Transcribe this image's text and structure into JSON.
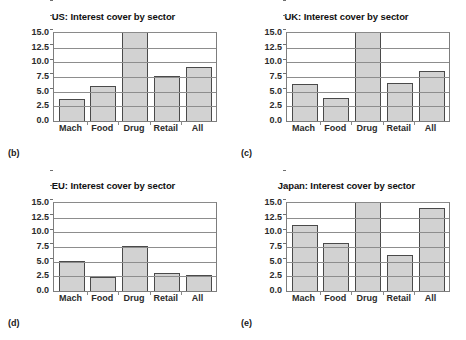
{
  "figure": {
    "background_color": "#ffffff",
    "bar_fill_color": "#d2d2d2",
    "bar_border_color": "#4a4a4a",
    "grid_color": "#8d8d8d",
    "axis_color": "#7d7d7d"
  },
  "panels": [
    {
      "caption": "(b)",
      "title": "US: Interest cover by sector",
      "chart_data": {
        "type": "bar",
        "title": "US: Interest cover by sector",
        "xlabel": "",
        "ylabel": "",
        "ylim": [
          0,
          15
        ],
        "yticks": [
          0.0,
          2.5,
          5.0,
          7.5,
          10.0,
          12.5,
          15.0
        ],
        "ytick_labels": [
          "0.0",
          "2.5",
          "5.0",
          "7.5",
          "10.0",
          "12.5",
          "15.0"
        ],
        "grid": true,
        "legend": "none",
        "categories": [
          "Mach",
          "Food",
          "Drug",
          "Retail",
          "All"
        ],
        "values": [
          3.7,
          6.0,
          15.4,
          7.7,
          9.2
        ],
        "clipped": [
          false,
          false,
          true,
          false,
          false
        ],
        "notes": "Drug bar exceeds the 15.0 axis maximum and is clipped at the top of the plot frame."
      }
    },
    {
      "caption": "(c)",
      "title": "UK: Interest cover by sector",
      "chart_data": {
        "type": "bar",
        "title": "UK: Interest cover by sector",
        "xlabel": "",
        "ylabel": "",
        "ylim": [
          0,
          15
        ],
        "yticks": [
          0.0,
          2.5,
          5.0,
          7.5,
          10.0,
          12.5,
          15.0
        ],
        "ytick_labels": [
          "0.0",
          "2.5",
          "5.0",
          "7.5",
          "10.0",
          "12.5",
          "15.0"
        ],
        "grid": true,
        "legend": "none",
        "categories": [
          "Mach",
          "Food",
          "Drug",
          "Retail",
          "All"
        ],
        "values": [
          6.3,
          4.0,
          15.4,
          6.4,
          8.6
        ],
        "clipped": [
          false,
          false,
          true,
          false,
          false
        ],
        "notes": "Drug bar exceeds the 15.0 axis maximum and is clipped at the top of the plot frame."
      }
    },
    {
      "caption": "(d)",
      "title": "EU: Interest cover by sector",
      "chart_data": {
        "type": "bar",
        "title": "EU: Interest cover by sector",
        "xlabel": "",
        "ylabel": "",
        "ylim": [
          0,
          15
        ],
        "yticks": [
          0.0,
          2.5,
          5.0,
          7.5,
          10.0,
          12.5,
          15.0
        ],
        "ytick_labels": [
          "0.0",
          "2.5",
          "5.0",
          "7.5",
          "10.0",
          "12.5",
          "15.0"
        ],
        "grid": true,
        "legend": "none",
        "categories": [
          "Mach",
          "Food",
          "Drug",
          "Retail",
          "All"
        ],
        "values": [
          5.1,
          2.4,
          7.7,
          3.0,
          2.8
        ],
        "clipped": [
          false,
          false,
          false,
          false,
          false
        ],
        "notes": ""
      }
    },
    {
      "caption": "(e)",
      "title": "Japan: Interest cover by sector",
      "chart_data": {
        "type": "bar",
        "title": "Japan: Interest cover by sector",
        "xlabel": "",
        "ylabel": "",
        "ylim": [
          0,
          15
        ],
        "yticks": [
          0.0,
          2.5,
          5.0,
          7.5,
          10.0,
          12.5,
          15.0
        ],
        "ytick_labels": [
          "0.0",
          "2.5",
          "5.0",
          "7.5",
          "10.0",
          "12.5",
          "15.0"
        ],
        "grid": true,
        "legend": "none",
        "categories": [
          "Mach",
          "Food",
          "Drug",
          "Retail",
          "All"
        ],
        "values": [
          11.2,
          8.1,
          15.4,
          6.2,
          14.2
        ],
        "clipped": [
          false,
          false,
          true,
          false,
          false
        ],
        "notes": "Drug bar exceeds the 15.0 axis maximum and is clipped at the top of the plot frame."
      }
    }
  ]
}
